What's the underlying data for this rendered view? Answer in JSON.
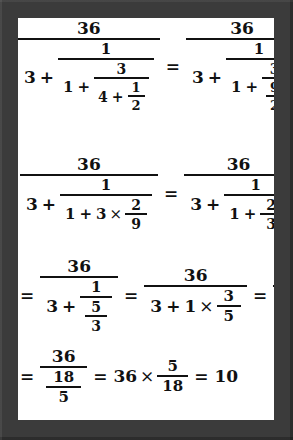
{
  "document": {
    "kind": "handwritten-style math worksheet",
    "title": "Continued fraction simplification",
    "frame_color": "#3b3b3b",
    "paper_color": "#ffffff",
    "ink_color": "#111111"
  },
  "symbols": {
    "equals": "=",
    "plus": "+",
    "times": "×"
  },
  "rows": [
    {
      "id": "row-1",
      "label": "step 1 and 2",
      "expressions": [
        {
          "id": "expr-1",
          "latex": "\\frac{36}{3+\\cfrac{1}{1+\\cfrac{3}{4+\\frac{1}{2}}}}",
          "numerator": "36",
          "denominator_lead": "3",
          "inner_numerator": "1",
          "level2_lead": "1",
          "level2_numerator": "3",
          "level3_lead": "4",
          "level3_numerator": "1",
          "level3_denominator": "2"
        },
        {
          "id": "expr-2",
          "latex": "\\frac{36}{3+\\cfrac{1}{1+\\cfrac{3}{\\frac{9}{2}}}}",
          "numerator": "36",
          "denominator_lead": "3",
          "inner_numerator": "1",
          "level2_lead": "1",
          "level2_numerator": "3",
          "level3_numerator": "9",
          "level3_denominator": "2"
        }
      ],
      "trailing_equals": "="
    },
    {
      "id": "row-2",
      "label": "step 3 and 4",
      "expressions": [
        {
          "id": "expr-3",
          "latex": "\\frac{36}{3+\\cfrac{1}{1+3\\times\\frac{2}{9}}}",
          "numerator": "36",
          "denominator_lead": "3",
          "inner_numerator": "1",
          "level2_lead": "1",
          "level2_factor": "3",
          "level2_frac_num": "2",
          "level2_frac_den": "9"
        },
        {
          "id": "expr-4",
          "latex": "\\frac{36}{3+\\cfrac{1}{1+\\frac{2}{3}}}",
          "numerator": "36",
          "denominator_lead": "3",
          "inner_numerator": "1",
          "level2_lead": "1",
          "level2_frac_num": "2",
          "level2_frac_den": "3"
        }
      ]
    },
    {
      "id": "row-3",
      "label": "step 5, 6 and 7",
      "expressions": [
        {
          "id": "expr-5",
          "latex": "\\frac{36}{3+\\cfrac{1}{\\frac{5}{3}}}",
          "numerator": "36",
          "denominator_lead": "3",
          "inner_numerator": "1",
          "inner_den_num": "5",
          "inner_den_den": "3"
        },
        {
          "id": "expr-6",
          "latex": "\\frac{36}{3+1\\times\\frac{3}{5}}",
          "numerator": "36",
          "denominator_lead": "3",
          "factor": "1",
          "frac_num": "3",
          "frac_den": "5"
        },
        {
          "id": "expr-7",
          "latex": "\\frac{36}{3+\\frac{3}{5}}",
          "numerator": "36",
          "denominator_lead": "3",
          "frac_num": "3",
          "frac_den": "5"
        }
      ],
      "leading_equals": "="
    },
    {
      "id": "row-4",
      "label": "final result",
      "expressions": [
        {
          "id": "expr-8",
          "latex": "\\frac{36}{\\frac{18}{5}}",
          "numerator": "36",
          "den_num": "18",
          "den_den": "5"
        },
        {
          "id": "expr-9",
          "latex": "36\\times\\frac{5}{18}",
          "factor": "36",
          "frac_num": "5",
          "frac_den": "18"
        },
        {
          "id": "expr-10",
          "latex": "10",
          "value": "10"
        }
      ],
      "leading_equals": "="
    }
  ]
}
